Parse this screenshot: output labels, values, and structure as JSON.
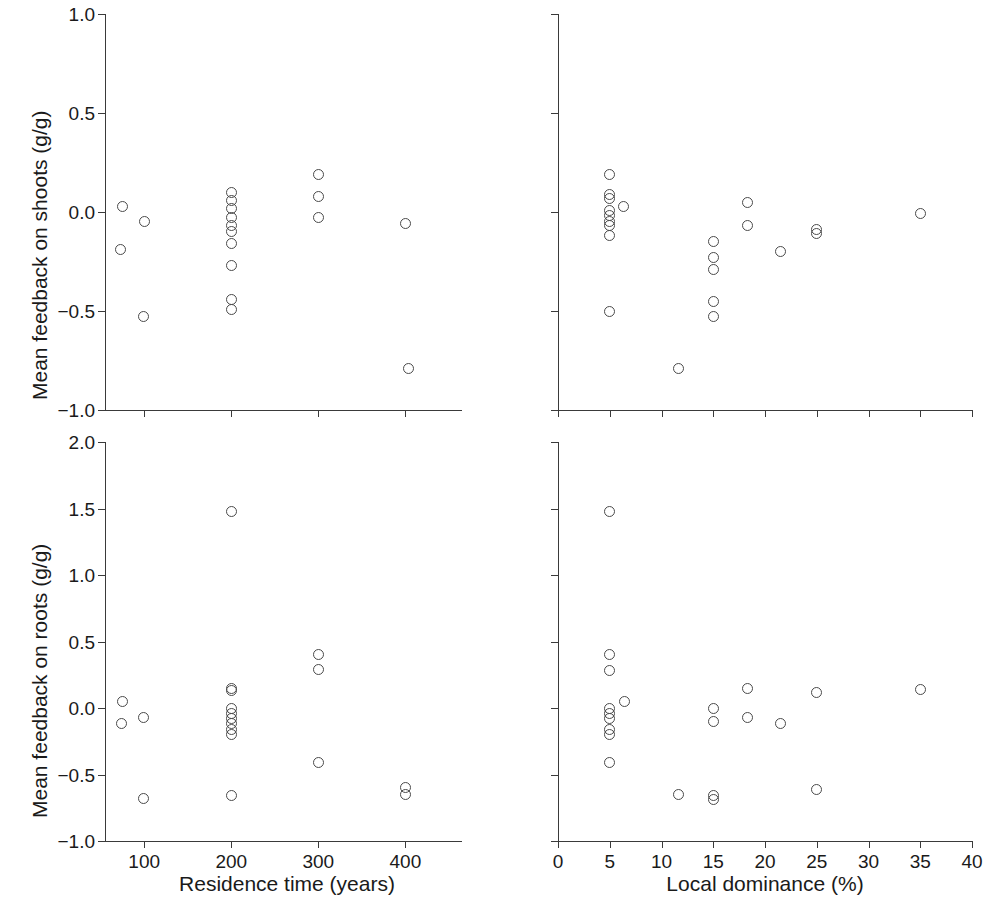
{
  "figure": {
    "title": "",
    "panels": [
      {
        "id": "top-left",
        "ylabel": "Mean feedback on shoots (g/g)",
        "xlabel": "",
        "xticklabels": [
          "100",
          "200",
          "300",
          "400"
        ],
        "yticklabels": [
          "1.0",
          "0.5",
          "0.0",
          "-0.5",
          "-1.0"
        ]
      },
      {
        "id": "top-right",
        "ylabel": "",
        "xlabel": "",
        "xticklabels": [],
        "yticklabels": []
      },
      {
        "id": "bottom-left",
        "ylabel": "Mean feedback on roots (g/g)",
        "xlabel": "Residence time (years)",
        "xticklabels": [
          "100",
          "200",
          "300",
          "400"
        ],
        "yticklabels": [
          "2.0",
          "1.5",
          "1.0",
          "0.5",
          "0.0",
          "-0.5",
          "-1.0"
        ]
      },
      {
        "id": "bottom-right",
        "ylabel": "",
        "xlabel": "Local dominance (%)",
        "xticklabels": [
          "0",
          "5",
          "10",
          "15",
          "20",
          "25",
          "30",
          "35",
          "40"
        ],
        "yticklabels": []
      }
    ],
    "marker_color": "#4a4a4a",
    "axis_color": "#3a3a3a"
  },
  "chart_data": [
    {
      "type": "scatter",
      "panel": "top-left",
      "title": "",
      "xlabel": "Residence time (years)",
      "ylabel": "Mean feedback on shoots (g/g)",
      "xlim": [
        55,
        465
      ],
      "ylim": [
        -1.0,
        1.0
      ],
      "xticks": [
        100,
        200,
        300,
        400
      ],
      "yticks": [
        -1.0,
        -0.5,
        0.0,
        0.5,
        1.0
      ],
      "grid": false,
      "legend": null,
      "points": [
        {
          "x": 75,
          "y": 0.03
        },
        {
          "x": 73,
          "y": -0.19
        },
        {
          "x": 100,
          "y": -0.05
        },
        {
          "x": 99,
          "y": -0.53
        },
        {
          "x": 200,
          "y": 0.1
        },
        {
          "x": 200,
          "y": 0.06
        },
        {
          "x": 200,
          "y": 0.02
        },
        {
          "x": 200,
          "y": -0.03
        },
        {
          "x": 200,
          "y": -0.07
        },
        {
          "x": 200,
          "y": -0.1
        },
        {
          "x": 200,
          "y": -0.16
        },
        {
          "x": 200,
          "y": -0.27
        },
        {
          "x": 200,
          "y": -0.44
        },
        {
          "x": 200,
          "y": -0.49
        },
        {
          "x": 300,
          "y": 0.19
        },
        {
          "x": 300,
          "y": 0.08
        },
        {
          "x": 300,
          "y": -0.03
        },
        {
          "x": 400,
          "y": -0.06
        },
        {
          "x": 403,
          "y": -0.79
        }
      ]
    },
    {
      "type": "scatter",
      "panel": "top-right",
      "title": "",
      "xlabel": "Local dominance (%)",
      "ylabel": "Mean feedback on shoots (g/g)",
      "xlim": [
        0,
        40
      ],
      "ylim": [
        -1.0,
        1.0
      ],
      "xticks": [
        0,
        5,
        10,
        15,
        20,
        25,
        30,
        35,
        40
      ],
      "yticks": [
        -1.0,
        -0.5,
        0.0,
        0.5,
        1.0
      ],
      "grid": false,
      "legend": null,
      "points": [
        {
          "x": 5.0,
          "y": 0.19
        },
        {
          "x": 5.0,
          "y": 0.09
        },
        {
          "x": 5.0,
          "y": 0.07
        },
        {
          "x": 5.0,
          "y": 0.01
        },
        {
          "x": 5.0,
          "y": -0.02
        },
        {
          "x": 5.0,
          "y": -0.05
        },
        {
          "x": 5.0,
          "y": -0.07
        },
        {
          "x": 5.0,
          "y": -0.12
        },
        {
          "x": 6.3,
          "y": 0.03
        },
        {
          "x": 5.0,
          "y": -0.5
        },
        {
          "x": 11.6,
          "y": -0.79
        },
        {
          "x": 15.0,
          "y": -0.15
        },
        {
          "x": 15.0,
          "y": -0.23
        },
        {
          "x": 15.0,
          "y": -0.29
        },
        {
          "x": 15.0,
          "y": -0.45
        },
        {
          "x": 15.0,
          "y": -0.53
        },
        {
          "x": 18.3,
          "y": 0.05
        },
        {
          "x": 18.3,
          "y": -0.07
        },
        {
          "x": 21.5,
          "y": -0.2
        },
        {
          "x": 25.0,
          "y": -0.09
        },
        {
          "x": 25.0,
          "y": -0.11
        },
        {
          "x": 35.0,
          "y": -0.01
        }
      ]
    },
    {
      "type": "scatter",
      "panel": "bottom-left",
      "title": "",
      "xlabel": "Residence time (years)",
      "ylabel": "Mean feedback on roots (g/g)",
      "xlim": [
        55,
        465
      ],
      "ylim": [
        -1.0,
        2.0
      ],
      "xticks": [
        100,
        200,
        300,
        400
      ],
      "yticks": [
        -1.0,
        -0.5,
        0.0,
        0.5,
        1.0,
        1.5,
        2.0
      ],
      "grid": false,
      "legend": null,
      "points": [
        {
          "x": 75,
          "y": 0.05
        },
        {
          "x": 74,
          "y": -0.12
        },
        {
          "x": 99,
          "y": -0.07
        },
        {
          "x": 99,
          "y": -0.68
        },
        {
          "x": 200,
          "y": 1.48
        },
        {
          "x": 200,
          "y": 0.15
        },
        {
          "x": 200,
          "y": 0.13
        },
        {
          "x": 200,
          "y": 0.0
        },
        {
          "x": 200,
          "y": -0.04
        },
        {
          "x": 200,
          "y": -0.08
        },
        {
          "x": 200,
          "y": -0.12
        },
        {
          "x": 200,
          "y": -0.16
        },
        {
          "x": 200,
          "y": -0.2
        },
        {
          "x": 200,
          "y": -0.66
        },
        {
          "x": 300,
          "y": 0.4
        },
        {
          "x": 300,
          "y": 0.29
        },
        {
          "x": 300,
          "y": -0.41
        },
        {
          "x": 400,
          "y": -0.6
        },
        {
          "x": 400,
          "y": -0.65
        }
      ]
    },
    {
      "type": "scatter",
      "panel": "bottom-right",
      "title": "",
      "xlabel": "Local dominance (%)",
      "ylabel": "Mean feedback on roots (g/g)",
      "xlim": [
        0,
        40
      ],
      "ylim": [
        -1.0,
        2.0
      ],
      "xticks": [
        0,
        5,
        10,
        15,
        20,
        25,
        30,
        35,
        40
      ],
      "yticks": [
        -1.0,
        -0.5,
        0.0,
        0.5,
        1.0,
        1.5,
        2.0
      ],
      "grid": false,
      "legend": null,
      "points": [
        {
          "x": 5.0,
          "y": 1.48
        },
        {
          "x": 5.0,
          "y": 0.4
        },
        {
          "x": 5.0,
          "y": 0.28
        },
        {
          "x": 5.0,
          "y": 0.0
        },
        {
          "x": 5.0,
          "y": -0.04
        },
        {
          "x": 5.0,
          "y": -0.08
        },
        {
          "x": 5.0,
          "y": -0.16
        },
        {
          "x": 5.0,
          "y": -0.2
        },
        {
          "x": 5.0,
          "y": -0.41
        },
        {
          "x": 6.4,
          "y": 0.05
        },
        {
          "x": 11.6,
          "y": -0.65
        },
        {
          "x": 15.0,
          "y": 0.0
        },
        {
          "x": 15.0,
          "y": -0.1
        },
        {
          "x": 15.0,
          "y": -0.66
        },
        {
          "x": 15.0,
          "y": -0.69
        },
        {
          "x": 18.3,
          "y": 0.15
        },
        {
          "x": 18.3,
          "y": -0.07
        },
        {
          "x": 21.5,
          "y": -0.12
        },
        {
          "x": 25.0,
          "y": 0.12
        },
        {
          "x": 25.0,
          "y": -0.61
        },
        {
          "x": 35.0,
          "y": 0.14
        }
      ]
    }
  ]
}
